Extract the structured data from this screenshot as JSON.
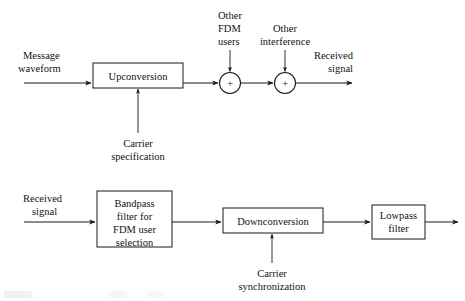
{
  "figure": {
    "background_color": "#ffffff",
    "line_color": "#1a1a1a",
    "text_color": "#121212"
  },
  "transmitter": {
    "input_label_line1": "Message",
    "input_label_line2": "waveform",
    "upconversion_block": "Upconversion",
    "carrier_label_line1": "Carrier",
    "carrier_label_line2": "specification",
    "adder1_symbol": "+",
    "adder2_symbol": "+",
    "adder1_input_line1": "Other",
    "adder1_input_line2": "FDM",
    "adder1_input_line3": "users",
    "adder2_input_line1": "Other",
    "adder2_input_line2": "interference",
    "output_label_line1": "Received",
    "output_label_line2": "signal"
  },
  "receiver": {
    "input_label_line1": "Received",
    "input_label_line2": "signal",
    "bandpass_block_line1": "Bandpass",
    "bandpass_block_line2": "filter for",
    "bandpass_block_line3": "FDM user",
    "bandpass_block_line4": "selection",
    "downconversion_block": "Downconversion",
    "carrier_label_line1": "Carrier",
    "carrier_label_line2": "synchronization",
    "lowpass_block_line1": "Lowpass",
    "lowpass_block_line2": "filter"
  }
}
